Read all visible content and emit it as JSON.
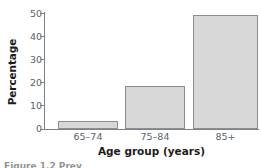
{
  "chart_data": {
    "type": "bar",
    "title": "",
    "xlabel": "Age group (years)",
    "ylabel": "Percentage",
    "categories": [
      "65–74",
      "75–84",
      "85+"
    ],
    "values": [
      3.3,
      18.5,
      49
    ],
    "ylim": [
      0,
      50
    ],
    "yticks": [
      0,
      10,
      20,
      30,
      40,
      50
    ],
    "ytick_labels": [
      "0",
      "10",
      "20",
      "30",
      "40",
      "50"
    ],
    "grid": false,
    "legend": null,
    "series": [
      {
        "name": "Percentage",
        "values": [
          3.3,
          18.5,
          49
        ]
      }
    ]
  },
  "style": {
    "bar_fill": "#d8d8d8",
    "bar_border": "#8a8e92",
    "axis_color": "#7d8287",
    "tick_label_color": "#5a5f66",
    "axis_title_color": "#1b1b1b",
    "background": "#ffffff"
  },
  "caption_sliver": "Figure 1.2 Prev"
}
